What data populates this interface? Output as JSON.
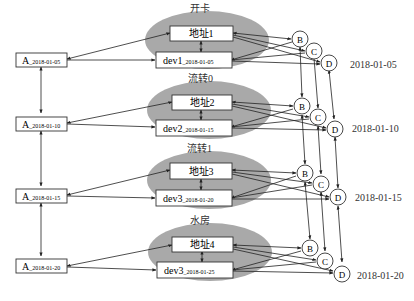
{
  "diagram": {
    "groups": [
      {
        "label": "开卡",
        "address": "地址1",
        "dev": "dev1",
        "dev_sub": "_2018-01-05",
        "a_main": "A",
        "a_sub": "_2018-01-05",
        "date": "2018-01-05"
      },
      {
        "label": "流转0",
        "address": "地址2",
        "dev": "dev2",
        "dev_sub": "_2018-01-15",
        "a_main": "A",
        "a_sub": "_2018-01-10",
        "date": "2018-01-10"
      },
      {
        "label": "流转1",
        "address": "地址3",
        "dev": "dev3",
        "dev_sub": "_2018-01-20",
        "a_main": "A",
        "a_sub": "_2018-01-15",
        "date": "2018-01-15"
      },
      {
        "label": "水房",
        "address": "地址4",
        "dev": "dev3",
        "dev_sub": "_2018-01-25",
        "a_main": "A",
        "a_sub": "_2018-01-20",
        "date": "2018-01-20"
      }
    ],
    "nodes": {
      "b": "B",
      "c": "C",
      "d": "D"
    },
    "colors": {
      "ellipse": "#a9a9a9",
      "stroke": "#222222",
      "box_fill": "#ffffff"
    }
  }
}
